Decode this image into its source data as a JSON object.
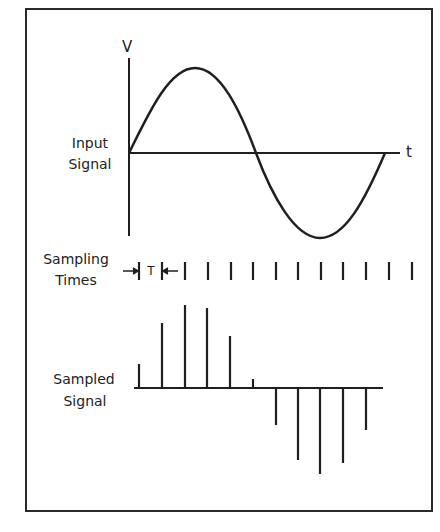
{
  "diagram": {
    "axis_labels": {
      "v": "V",
      "t": "t"
    },
    "input_signal": {
      "label_line1": "Input",
      "label_line2": "Signal"
    },
    "sampling_times": {
      "label_line1": "Sampling",
      "label_line2": "Times",
      "period_label": "T",
      "tick_count": 13
    },
    "sampled_signal": {
      "label_line1": "Sampled",
      "label_line2": "Signal",
      "samples": [
        0.3,
        0.8,
        1.0,
        0.95,
        0.65,
        0.08,
        -0.45,
        -0.9,
        -1.05,
        -0.93,
        -0.5
      ]
    },
    "colors": {
      "line": "#1f1f1f",
      "background": "#ffffff"
    }
  }
}
